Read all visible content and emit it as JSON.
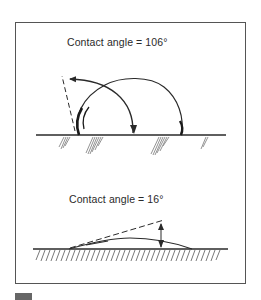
{
  "figure": {
    "top_panel": {
      "label": "Contact angle = 106°",
      "angle_degrees": 106,
      "description": "hydrophobic droplet, high contact angle"
    },
    "bottom_panel": {
      "label": "Contact angle = 16°",
      "angle_degrees": 16,
      "description": "hydrophilic spreading film, low contact angle"
    }
  },
  "colors": {
    "ink": "#2a2a2a",
    "frame": "#555555",
    "swatch": "#666666"
  }
}
